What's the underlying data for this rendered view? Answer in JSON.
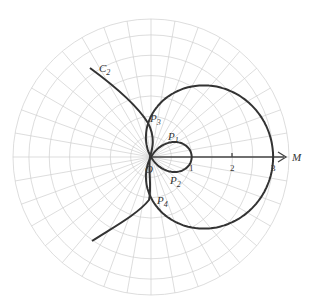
{
  "diagram": {
    "type": "polar-plot",
    "axis_label": "M",
    "origin_label": "O",
    "ticks": [
      "1",
      "2",
      "3"
    ],
    "curves": [
      {
        "name": "C1",
        "description": "limaçon with inner loop, r = 1 + 2cosθ"
      },
      {
        "name": "C2",
        "label": "C",
        "label_sub": "2",
        "description": "open curve crossing near pole"
      }
    ],
    "points": [
      {
        "label": "P",
        "sub": "1"
      },
      {
        "label": "P",
        "sub": "2"
      },
      {
        "label": "P",
        "sub": "3"
      },
      {
        "label": "P",
        "sub": "4"
      }
    ],
    "colors": {
      "grid": "#cfcfcf",
      "curve": "#333333"
    }
  }
}
